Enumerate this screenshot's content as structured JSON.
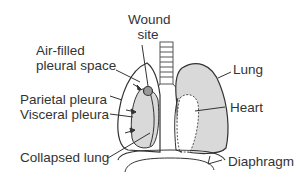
{
  "diagram": {
    "labels": {
      "wound_site_line1": "Wound",
      "wound_site_line2": "site",
      "air_filled_line1": "Air-filled",
      "air_filled_line2": "pleural space",
      "lung": "Lung",
      "parietal_pleura": "Parietal pleura",
      "visceral_pleura": "Visceral pleura",
      "heart": "Heart",
      "collapsed_lung": "Collapsed lung",
      "diaphragm": "Diaphragm"
    },
    "colors": {
      "lung_fill": "#d9d9d9",
      "outline": "#333333",
      "text": "#333333",
      "background": "#ffffff"
    }
  }
}
